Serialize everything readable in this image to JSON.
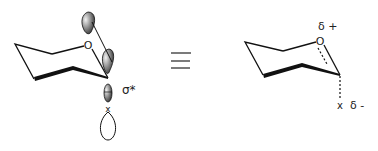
{
  "diagram": {
    "left": {
      "ring_atom": "O",
      "orbital_label": "σ*",
      "substituent": "x"
    },
    "equivalence_symbol": "≡",
    "right": {
      "ring_atom": "O",
      "partial_positive": "δ +",
      "substituent": "x",
      "partial_negative": "δ -"
    },
    "colors": {
      "line": "#111111",
      "lobe_dark": "#555555",
      "lobe_light": "#dddddd"
    }
  }
}
